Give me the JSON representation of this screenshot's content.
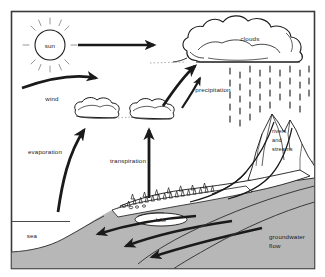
{
  "frame": {
    "border_color": "#3a3a3a",
    "background": "#ffffff"
  },
  "colors": {
    "land_gray": "#b7b7b7",
    "land_gray_dark": "#a8a8a8",
    "ink": "#1a1a1a",
    "sea_fill": "#ffffff",
    "cloud_fill": "#ffffff"
  },
  "labels": {
    "sun": "sun",
    "wind": "wind",
    "evaporation": "evaporation",
    "transpiration": "transpiration",
    "clouds": "clouds",
    "precipitation": "precipitation",
    "rivers_line1": "rivers",
    "rivers_line2": "and",
    "rivers_line3": "streams",
    "lake": "lake",
    "sea": "sea",
    "groundwater_line1": "groundwater",
    "groundwater_line2": "flow"
  },
  "elements": {
    "sun_icon": "sun-icon",
    "cloud_large": "cloud-large",
    "cloud_small_left": "cloud-small-left",
    "cloud_small_right": "cloud-small-right",
    "rain_field": "rain-icon",
    "mountain_range": "mountain-icon",
    "forest": "tree-icon",
    "lake_body": "lake-shape",
    "sea_body": "sea-shape",
    "wind_arrow": "wind-arrow",
    "sun_arrow": "sun-arrow",
    "evaporation_arrow": "evaporation-arrow",
    "transpiration_arrow": "transpiration-arrow",
    "lake_arrow": "lake-arrow",
    "cloud_arrow": "cloud-arrow",
    "groundwater_arrows": "groundwater-arrow"
  }
}
